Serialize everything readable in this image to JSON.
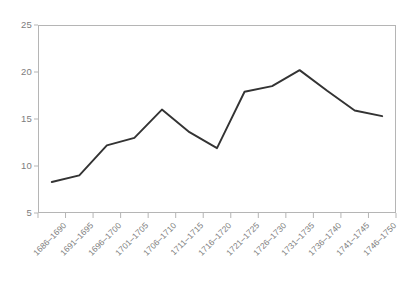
{
  "chart_data": {
    "type": "line",
    "title": "",
    "xlabel": "",
    "ylabel": "",
    "categories": [
      "1686–1690",
      "1691–1695",
      "1696–1700",
      "1701–1705",
      "1706–1710",
      "1711–1715",
      "1716–1720",
      "1721–1725",
      "1726–1730",
      "1731–1735",
      "1736–1740",
      "1741–1745",
      "1746–1750"
    ],
    "values": [
      8.3,
      9.0,
      12.2,
      13.0,
      16.0,
      13.6,
      11.9,
      17.9,
      18.5,
      20.2,
      18.0,
      15.9,
      15.3
    ],
    "ylim": [
      5,
      25
    ],
    "yticks": [
      5,
      10,
      15,
      20,
      25
    ],
    "ytick_labels": [
      "5",
      "10",
      "15",
      "20",
      "25"
    ],
    "grid": false,
    "legend": false,
    "legend_position": "none",
    "series_color": "#333333",
    "axis_color": "#b5b5b5",
    "tick_label_color": "#7d7d7d"
  }
}
